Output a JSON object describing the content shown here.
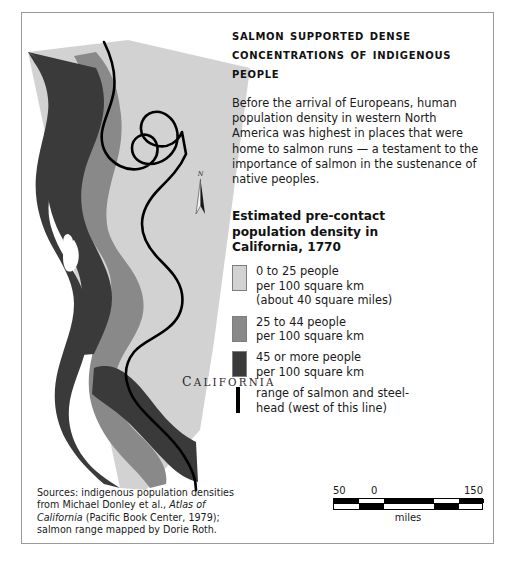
{
  "headline": "Salmon supported dense concentrations of indigenous people",
  "body": "Before the arrival of Europeans, human population density in western North America was highest in places that were home to salmon runs — a testament to the importance of salmon in the sustenance of native peoples.",
  "legend": {
    "title": "Estimated pre-contact population density in California, 1770",
    "items": [
      {
        "swatch": "light-gray",
        "color": "#d2d2d2",
        "line1": "0 to 25 people",
        "line2": "per 100 square km",
        "line3": "(about 40 square miles)"
      },
      {
        "swatch": "medium-gray",
        "color": "#898989",
        "line1": "25 to 44 people",
        "line2": "per 100 square km",
        "line3": ""
      },
      {
        "swatch": "dark-gray",
        "color": "#3a3a3a",
        "line1": "45 or more people",
        "line2": "per 100 square km",
        "line3": ""
      },
      {
        "swatch": "black-line",
        "color": "#000000",
        "line1": "range of salmon and steel-",
        "line2": "head (west of this line)",
        "line3": ""
      }
    ]
  },
  "map": {
    "state_label": "CALIFORNIA",
    "compass_label": "N"
  },
  "sources": {
    "part1": "Sources: indigenous population densities from Michael Donley et al., ",
    "italic": "Atlas of California",
    "part2": " (Pacific Book Center, 1979); salmon range mapped by Dorie Roth."
  },
  "scale": {
    "left": "50",
    "mid": "0",
    "right": "150",
    "unit": "miles"
  },
  "colors": {
    "low": "#d2d2d2",
    "mid": "#898989",
    "high": "#3a3a3a",
    "salmon_line": "#000000",
    "frame": "#9a9a9a"
  }
}
